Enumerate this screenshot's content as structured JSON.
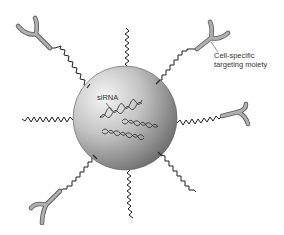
{
  "diagram": {
    "type": "nanoparticle-sirna-delivery",
    "labels": {
      "sirna": "siRNA",
      "targeting_line1": "Cell-specific",
      "targeting_line2": "targeting moiety"
    },
    "colors": {
      "background": "#ffffff",
      "sphere_light": "#f2f2f2",
      "sphere_mid": "#b5b5b5",
      "sphere_dark": "#6e6e6e",
      "chain": "#1e1e1e",
      "antibody_fill": "#a8a8a8",
      "antibody_stroke": "#555555",
      "text": "#333333"
    },
    "nanoparticle": {
      "cx": 125,
      "cy": 118,
      "r": 52
    },
    "peg_chains": [
      {
        "id": "top",
        "from": [
          128,
          67
        ],
        "to": [
          126,
          27
        ],
        "has_ligand": false
      },
      {
        "id": "bottom",
        "from": [
          130,
          170
        ],
        "to": [
          133,
          218
        ],
        "has_ligand": false
      },
      {
        "id": "left",
        "from": [
          73,
          120
        ],
        "to": [
          22,
          121
        ],
        "has_ligand": false
      },
      {
        "id": "right",
        "from": [
          177,
          123
        ],
        "to": [
          222,
          116
        ],
        "has_ligand": true
      },
      {
        "id": "upper-left",
        "from": [
          89,
          86
        ],
        "to": [
          50,
          48
        ],
        "has_ligand": true
      },
      {
        "id": "upper-right",
        "from": [
          158,
          80
        ],
        "to": [
          197,
          49
        ],
        "has_ligand": true
      },
      {
        "id": "lower-left",
        "from": [
          95,
          157
        ],
        "to": [
          60,
          191
        ],
        "has_ligand": true
      },
      {
        "id": "lower-right",
        "from": [
          161,
          155
        ],
        "to": [
          196,
          192
        ],
        "has_ligand": false
      }
    ],
    "sirna_strands": 3
  }
}
